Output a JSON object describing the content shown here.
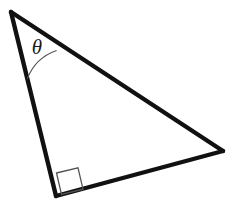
{
  "figure": {
    "background_color": "#ffffff",
    "width": 232,
    "height": 211
  },
  "chart_data": {
    "type": "diagram",
    "subtype": "geometry-right-triangle",
    "vertices": [
      {
        "id": "A",
        "role": "theta-apex",
        "x": 11,
        "y": 12
      },
      {
        "id": "B",
        "role": "right-angle",
        "x": 56,
        "y": 196
      },
      {
        "id": "C",
        "role": "far-right",
        "x": 223,
        "y": 151
      }
    ],
    "edges": [
      {
        "id": "AB",
        "from": "A",
        "to": "B",
        "role": "left-leg",
        "stroke": "#111111",
        "stroke_width": 4.4
      },
      {
        "id": "BC",
        "from": "B",
        "to": "C",
        "role": "bottom-leg",
        "stroke": "#111111",
        "stroke_width": 4.4
      },
      {
        "id": "CA",
        "from": "C",
        "to": "A",
        "role": "hypotenuse",
        "stroke": "#111111",
        "stroke_width": 4.4
      }
    ],
    "angle_markers": [
      {
        "id": "theta-arc",
        "at_vertex": "A",
        "label": "θ",
        "label_x": 37,
        "label_y": 49,
        "label_font_size": 21,
        "radius": 48,
        "stroke": "#555555",
        "stroke_width": 1.1,
        "path": "M 27.3 78.8 A 48 48 0 0 1 56.6 50.5"
      },
      {
        "id": "right-angle-square",
        "at_vertex": "B",
        "label": "",
        "size": 22,
        "stroke": "#555555",
        "stroke_width": 1.3,
        "path": "M 56.5 173.0 L 78.0 167.8 L 83.0 189.2 L 61.5 194.5 Z"
      }
    ],
    "labels": [
      {
        "id": "theta",
        "text": "θ",
        "x": 37,
        "y": 49
      }
    ],
    "colors": {
      "edge": "#111111",
      "marker": "#555555",
      "label": "#1a1a1a",
      "background": "#ffffff"
    },
    "grid": false,
    "legend": null,
    "axes": null
  }
}
